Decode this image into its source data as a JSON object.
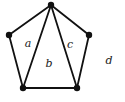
{
  "figure": {
    "background_color": "#ffffff",
    "edge_color": "#111111",
    "vertex_color": "#111111",
    "label_color": "#1a1a1a",
    "edge_width": 1.8,
    "vertex_radius": 3.2
  },
  "graph": {
    "vertices": [
      {
        "id": "top",
        "name": "vertex-top",
        "x": 51,
        "y": 5
      },
      {
        "id": "left",
        "name": "vertex-left",
        "x": 9,
        "y": 35
      },
      {
        "id": "right",
        "name": "vertex-right",
        "x": 89,
        "y": 35
      },
      {
        "id": "bottom-left",
        "name": "vertex-bottom-left",
        "x": 23,
        "y": 88
      },
      {
        "id": "bottom-right",
        "name": "vertex-bottom-right",
        "x": 77,
        "y": 88
      }
    ],
    "edges": [
      {
        "id": "e1",
        "name": "edge-top-left",
        "from": "top",
        "to": "left"
      },
      {
        "id": "e2",
        "name": "edge-top-bottom-left",
        "from": "top",
        "to": "bottom-left"
      },
      {
        "id": "e3",
        "name": "edge-top-bottom-right",
        "from": "top",
        "to": "bottom-right"
      },
      {
        "id": "e4",
        "name": "edge-top-right",
        "from": "top",
        "to": "right"
      },
      {
        "id": "e5",
        "name": "edge-left-bottom-left",
        "from": "left",
        "to": "bottom-left"
      },
      {
        "id": "e6",
        "name": "edge-right-bottom-right",
        "from": "right",
        "to": "bottom-right"
      },
      {
        "id": "e7",
        "name": "edge-bottom-left-bottom-right",
        "from": "bottom-left",
        "to": "bottom-right"
      }
    ],
    "face_labels": [
      {
        "id": "a",
        "name": "face-label-a",
        "text": "a",
        "x": 28,
        "y": 43
      },
      {
        "id": "b",
        "name": "face-label-b",
        "text": "b",
        "x": 49,
        "y": 63
      },
      {
        "id": "c",
        "name": "face-label-c",
        "text": "c",
        "x": 70,
        "y": 44
      },
      {
        "id": "d",
        "name": "face-label-d",
        "text": "d",
        "x": 109,
        "y": 60
      }
    ]
  }
}
